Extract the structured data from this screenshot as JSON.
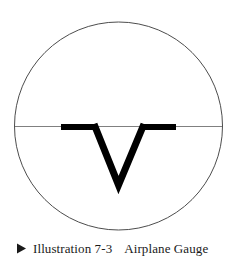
{
  "figure": {
    "caption": {
      "marker_icon": "right-triangle-bullet-icon",
      "label": "Illustration 7-3",
      "title": "Airplane Gauge",
      "separator_text": "   "
    },
    "colors": {
      "background": "#ffffff",
      "circle_stroke": "#4d4d4d",
      "horizon_line": "#808080",
      "symbol_fill": "#000000",
      "caption_text": "#1a1a1a"
    },
    "diagram": {
      "name": "attitude-indicator-airplane-symbol",
      "circle": {
        "center_x": 118.5,
        "center_y": 126,
        "radius": 104,
        "stroke_width": 1
      },
      "horizon_line": {
        "x1": 15,
        "y1": 126.5,
        "x2": 222,
        "y2": 126.5,
        "stroke_width": 1
      },
      "left_wing_bar": {
        "x": 61,
        "y": 124,
        "width": 35,
        "height": 6
      },
      "right_wing_bar": {
        "x": 142,
        "y": 124,
        "width": 34,
        "height": 6
      },
      "v_symbol": {
        "left_top_x": 93,
        "left_top_y": 124,
        "vertex_x": 118.5,
        "vertex_y": 185,
        "right_top_x": 145,
        "right_top_y": 124,
        "stroke_width": 7
      }
    }
  }
}
